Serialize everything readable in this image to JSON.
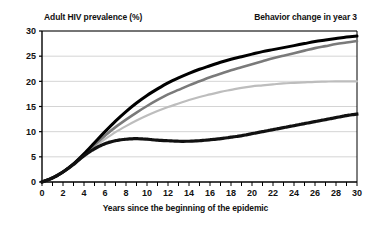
{
  "header": {
    "left_title": "Adult HIV prevalence (%)",
    "right_title": "Behavior change in year 3"
  },
  "axis": {
    "x_caption": "Years since the beginning of the epidemic",
    "y_ticks": [
      "0",
      "5",
      "10",
      "15",
      "20",
      "25",
      "30"
    ],
    "x_ticks": [
      "0",
      "2",
      "4",
      "6",
      "8",
      "10",
      "12",
      "14",
      "16",
      "18",
      "20",
      "22",
      "24",
      "26",
      "28",
      "30"
    ]
  },
  "colors": {
    "series_black": "#000000",
    "series_dark_gray": "#7a7a7a",
    "series_light_gray": "#bdbdbd",
    "series_dotted": "#111111",
    "gridline": "#c9c9c9",
    "frame": "#000000",
    "background": "#ffffff"
  },
  "chart_data": {
    "type": "line",
    "title": "Adult HIV prevalence (%)",
    "annotation": "Behavior change in year 3",
    "xlabel": "Years since the beginning of the epidemic",
    "ylabel": "Adult HIV prevalence (%)",
    "xlim": [
      0,
      30
    ],
    "ylim": [
      0,
      30
    ],
    "xticks": [
      0,
      2,
      4,
      6,
      8,
      10,
      12,
      14,
      16,
      18,
      20,
      22,
      24,
      26,
      28,
      30
    ],
    "yticks": [
      0,
      5,
      10,
      15,
      20,
      25,
      30
    ],
    "x_minor_tick_step": 1,
    "grid": "horizontal",
    "legend": "none",
    "x": [
      0,
      1,
      2,
      3,
      4,
      5,
      6,
      7,
      8,
      9,
      10,
      11,
      12,
      13,
      14,
      15,
      16,
      17,
      18,
      19,
      20,
      21,
      22,
      23,
      24,
      25,
      26,
      27,
      28,
      29,
      30
    ],
    "series": [
      {
        "name": "No behavior change",
        "style": "solid",
        "color": "#000000",
        "width": 3,
        "values": [
          0.0,
          0.8,
          2.0,
          3.6,
          5.6,
          7.8,
          10.0,
          12.1,
          14.0,
          15.7,
          17.2,
          18.5,
          19.7,
          20.7,
          21.6,
          22.4,
          23.1,
          23.8,
          24.4,
          24.9,
          25.4,
          25.9,
          26.3,
          26.7,
          27.1,
          27.5,
          27.9,
          28.2,
          28.5,
          28.8,
          29.0
        ]
      },
      {
        "name": "Small behavior change",
        "style": "solid",
        "color": "#7a7a7a",
        "width": 2.6,
        "values": [
          0.0,
          0.8,
          2.0,
          3.6,
          5.5,
          7.4,
          9.2,
          10.9,
          12.4,
          13.8,
          15.1,
          16.3,
          17.4,
          18.3,
          19.2,
          20.0,
          20.8,
          21.5,
          22.2,
          22.8,
          23.4,
          24.0,
          24.6,
          25.1,
          25.6,
          26.1,
          26.6,
          27.0,
          27.4,
          27.7,
          28.0
        ]
      },
      {
        "name": "Moderate behavior change",
        "style": "solid",
        "color": "#bdbdbd",
        "width": 2.2,
        "values": [
          0.0,
          0.8,
          2.0,
          3.5,
          5.3,
          7.0,
          8.5,
          9.9,
          11.1,
          12.2,
          13.2,
          14.1,
          14.9,
          15.6,
          16.3,
          16.9,
          17.4,
          17.9,
          18.3,
          18.7,
          19.0,
          19.2,
          19.4,
          19.6,
          19.7,
          19.8,
          19.9,
          19.95,
          20.0,
          20.0,
          20.0
        ]
      },
      {
        "name": "Large behavior change",
        "style": "dotted",
        "color": "#111111",
        "width": 3.2,
        "values": [
          0.0,
          0.8,
          2.0,
          3.5,
          5.2,
          6.6,
          7.6,
          8.2,
          8.5,
          8.6,
          8.5,
          8.3,
          8.2,
          8.1,
          8.1,
          8.2,
          8.4,
          8.6,
          8.9,
          9.2,
          9.6,
          10.0,
          10.4,
          10.8,
          11.2,
          11.6,
          12.0,
          12.4,
          12.8,
          13.2,
          13.5
        ]
      }
    ]
  }
}
